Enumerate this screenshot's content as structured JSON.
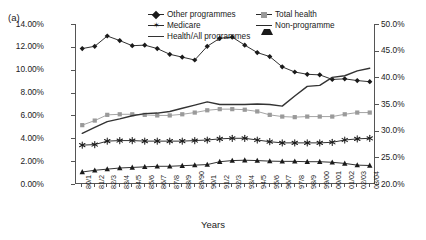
{
  "panel": {
    "label": "(a)"
  },
  "axes": {
    "xlabel": "Years",
    "y_left": {
      "ticks": [
        "0.00%",
        "2.00%",
        "4.00%",
        "6.00%",
        "8.00%",
        "10.00%",
        "12.00%",
        "14.00%"
      ],
      "min": 0,
      "max": 14
    },
    "y_right": {
      "ticks": [
        "20.0%",
        "25.0%",
        "30.0%",
        "35.0%",
        "40.0%",
        "45.0%",
        "50.0%"
      ],
      "min": 20,
      "max": 50
    }
  },
  "legend": {
    "items": [
      {
        "label": "Other programmes",
        "marker": "diamond",
        "color": "#1a1a1a"
      },
      {
        "label": "Total health",
        "marker": "square",
        "color": "#9a9a9a"
      },
      {
        "label": "Medicare",
        "marker": "star",
        "color": "#1a1a1a"
      },
      {
        "label": "Non-programme",
        "marker": "triangle",
        "color": "#1a1a1a"
      },
      {
        "label": "Health/All programmes",
        "marker": "line",
        "color": "#333333"
      }
    ]
  },
  "chart_data": {
    "type": "line",
    "title": "",
    "xlabel": "Years",
    "ylabel": "",
    "grid": false,
    "legend_position": "top-center",
    "categories": [
      "80/1",
      "81/2",
      "82/3",
      "83/4",
      "84/5",
      "85/6",
      "86/7",
      "87/8",
      "88/9",
      "89/90",
      "90/1",
      "91/2",
      "92/3",
      "93/4",
      "94/5",
      "95/6",
      "96/7",
      "97/8",
      "98/9",
      "99/00",
      "00/01",
      "01/02",
      "02/03",
      "03/04"
    ],
    "ylim": [
      0,
      14
    ],
    "ylim_right": [
      20,
      50
    ],
    "series": [
      {
        "name": "Other programmes",
        "axis": "left",
        "marker": "diamond",
        "color": "#1a1a1a",
        "values": [
          11.85,
          12.05,
          12.95,
          12.55,
          12.1,
          12.15,
          11.85,
          11.35,
          11.1,
          10.85,
          12.05,
          12.75,
          12.85,
          12.15,
          11.5,
          11.15,
          10.25,
          9.8,
          9.6,
          9.55,
          9.15,
          9.2,
          9.05,
          8.95
        ]
      },
      {
        "name": "Total health",
        "axis": "left",
        "marker": "square",
        "color": "#9a9a9a",
        "values": [
          5.15,
          5.55,
          6.05,
          6.1,
          6.1,
          6.05,
          6.0,
          6.0,
          6.1,
          6.25,
          6.45,
          6.55,
          6.55,
          6.5,
          6.35,
          6.05,
          5.9,
          5.85,
          5.9,
          5.9,
          5.9,
          6.1,
          6.25,
          6.25
        ]
      },
      {
        "name": "Medicare",
        "axis": "left",
        "marker": "star",
        "color": "#1a1a1a",
        "values": [
          3.4,
          3.45,
          3.75,
          3.8,
          3.8,
          3.75,
          3.75,
          3.75,
          3.75,
          3.8,
          3.85,
          3.95,
          4.0,
          4.0,
          3.85,
          3.7,
          3.6,
          3.6,
          3.6,
          3.6,
          3.65,
          3.85,
          3.95,
          4.0
        ]
      },
      {
        "name": "Non-programme",
        "axis": "left",
        "marker": "triangle",
        "color": "#1a1a1a",
        "values": [
          1.05,
          1.2,
          1.3,
          1.4,
          1.45,
          1.5,
          1.55,
          1.55,
          1.6,
          1.65,
          1.7,
          1.95,
          2.05,
          2.08,
          2.05,
          2.0,
          1.98,
          1.98,
          1.95,
          1.95,
          1.9,
          1.8,
          1.65,
          1.62
        ]
      },
      {
        "name": "Health/All programmes",
        "axis": "right",
        "marker": "none",
        "color": "#333333",
        "values": [
          29.5,
          30.6,
          31.7,
          32.2,
          32.8,
          33.2,
          33.3,
          33.6,
          34.2,
          34.8,
          35.4,
          34.9,
          34.9,
          34.9,
          35.0,
          34.9,
          34.6,
          36.5,
          38.3,
          38.5,
          40.0,
          40.3,
          41.2,
          41.7
        ]
      }
    ]
  }
}
